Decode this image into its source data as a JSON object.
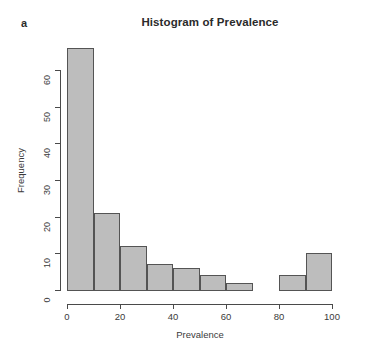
{
  "panel": {
    "label": "a"
  },
  "chart_data": {
    "type": "bar",
    "title": "Histogram of Prevalence",
    "xlabel": "Prevalence",
    "ylabel": "Frequency",
    "binwidth": 10,
    "bin_edges": [
      0,
      10,
      20,
      30,
      40,
      50,
      60,
      70,
      80,
      90,
      100
    ],
    "categories": [
      "0-10",
      "10-20",
      "20-30",
      "30-40",
      "40-50",
      "50-60",
      "60-70",
      "70-80",
      "80-90",
      "90-100"
    ],
    "values": [
      66,
      21,
      12,
      7,
      6,
      4,
      2,
      0,
      4,
      10
    ],
    "bins": [
      {
        "start": 0,
        "end": 10,
        "count": 66
      },
      {
        "start": 10,
        "end": 20,
        "count": 21
      },
      {
        "start": 20,
        "end": 30,
        "count": 12
      },
      {
        "start": 30,
        "end": 40,
        "count": 7
      },
      {
        "start": 40,
        "end": 50,
        "count": 6
      },
      {
        "start": 50,
        "end": 60,
        "count": 4
      },
      {
        "start": 60,
        "end": 70,
        "count": 2
      },
      {
        "start": 70,
        "end": 80,
        "count": 0
      },
      {
        "start": 80,
        "end": 90,
        "count": 4
      },
      {
        "start": 90,
        "end": 100,
        "count": 10
      }
    ],
    "xlim": [
      0,
      100
    ],
    "ylim": [
      0,
      66
    ],
    "xticks": [
      0,
      20,
      40,
      60,
      80,
      100
    ],
    "xtick_labels": [
      "0",
      "20",
      "40",
      "60",
      "80",
      "100"
    ],
    "yticks": [
      0,
      10,
      20,
      30,
      40,
      50,
      60
    ],
    "ytick_labels": [
      "0",
      "10",
      "20",
      "30",
      "40",
      "50",
      "60"
    ],
    "grid": false,
    "legend": false,
    "colors": {
      "bar_fill": "#bdbdbd",
      "bar_border": "#545454",
      "axis": "#4a4a4a",
      "text": "#3b3b3b",
      "background": "#ffffff"
    }
  }
}
